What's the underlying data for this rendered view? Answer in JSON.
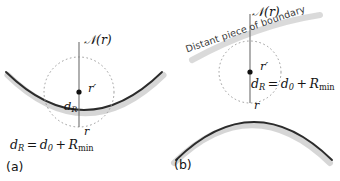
{
  "figure": {
    "type": "diagram",
    "background_color": "#ffffff",
    "curve_color": "#2b2b2b",
    "halo_color": "#cccccc",
    "dotted_circle_color": "#8f8f8f",
    "normal_line_color": "#6e6e6e",
    "dot_color": "#111111"
  },
  "panels": [
    {
      "id": "a",
      "caption": "(a)",
      "boundary_shape": "concave",
      "labels": {
        "normal": "𝒩(r)",
        "normal_plain": "N(r)",
        "point_above": "r′",
        "radius": "d",
        "radius_sub": "R",
        "surface_point": "r"
      },
      "equation": {
        "lhs": "d",
        "lhs_sub": "R",
        "eq": "=",
        "t1": "d",
        "t1_sub": "0",
        "plus": "+",
        "t2": "R",
        "t2_sub": "min",
        "full": "d_R = d_0 + R_min"
      }
    },
    {
      "id": "b",
      "caption": "(b)",
      "boundary_shape": "convex",
      "annotation": "Distant piece of boundary",
      "labels": {
        "normal": "𝒩(r)",
        "normal_plain": "N(r)",
        "point_above": "r′",
        "surface_point": "r"
      },
      "equation": {
        "lhs": "d",
        "lhs_sub": "R",
        "eq": "=",
        "t1": "d",
        "t1_sub": "0",
        "plus": "+",
        "t2": "R",
        "t2_sub": "min",
        "full": "d_R = d_0 + R_min"
      }
    }
  ]
}
